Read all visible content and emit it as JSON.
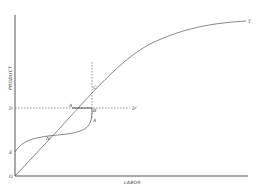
{
  "diagram": {
    "axes": {
      "x_label": "LABOR",
      "y_label": "PRODUCT",
      "origin_label": "O"
    },
    "points": {
      "D": "D",
      "D_prime": "D'",
      "E": "E",
      "N": "N",
      "A": "A",
      "B": "B",
      "C": "C",
      "A_low": "A",
      "T": "T"
    },
    "colors": {
      "line": "#555555",
      "axis": "#444444",
      "background": "#ffffff"
    }
  }
}
